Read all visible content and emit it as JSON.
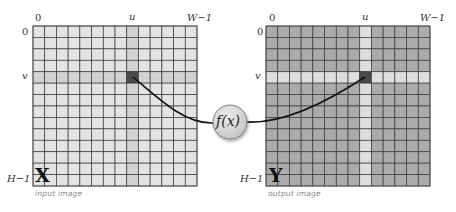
{
  "diagram": {
    "grid": {
      "columns": 14,
      "rows": 14,
      "highlight_col": 8,
      "highlight_row": 4
    },
    "input_image": {
      "symbol": "X",
      "caption": "input image",
      "col_label_start": "0",
      "col_label_u": "u",
      "col_label_end": "W−1",
      "row_label_start": "0",
      "row_label_v": "v",
      "row_label_end": "H−1",
      "colors": {
        "cell": "#e3e3e3",
        "cross": "#d2d2d2",
        "target": "#4a4a4a",
        "line": "#3a3a3a"
      }
    },
    "output_image": {
      "symbol": "Y",
      "caption": "output image",
      "col_label_start": "0",
      "col_label_u": "u",
      "col_label_end": "W−1",
      "row_label_start": "0",
      "row_label_v": "v",
      "row_label_end": "H−1",
      "colors": {
        "cell": "#ababab",
        "cross": "#dedede",
        "target": "#4a4a4a",
        "line": "#3a3a3a"
      }
    },
    "function_node": {
      "label": "f(x)",
      "fill": "#d6d6d6",
      "stroke": "#777777"
    },
    "connector_color": "#111111"
  }
}
